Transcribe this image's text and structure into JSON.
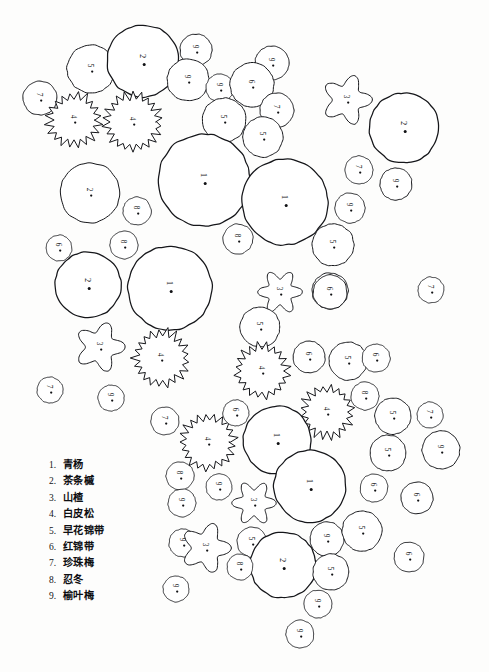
{
  "drawing": {
    "title": "园林种植平面图",
    "background_color": "#fdfdfc",
    "ink_color": "#15161a",
    "legend": {
      "items": [
        {
          "num": "1.",
          "name": "青杨"
        },
        {
          "num": "2.",
          "name": "茶条槭"
        },
        {
          "num": "3.",
          "name": "山楂"
        },
        {
          "num": "4.",
          "name": "白皮松"
        },
        {
          "num": "5.",
          "name": "早花锦带"
        },
        {
          "num": "6.",
          "name": "红锦带"
        },
        {
          "num": "7.",
          "name": "珍珠梅"
        },
        {
          "num": "8.",
          "name": "忍冬"
        },
        {
          "num": "9.",
          "name": "榆叶梅"
        }
      ]
    },
    "symbol_types": {
      "circle": "plain circle canopy outline",
      "spiky": "conifer canopy with sawtooth edge (白皮松)",
      "lobed": "cloud/flower lobed canopy (山楂)"
    },
    "plants": [
      {
        "id": "p01",
        "label": "7",
        "shape": "circle",
        "cx": 40,
        "cy": 98,
        "r": 17
      },
      {
        "id": "p02",
        "label": "5",
        "shape": "circle",
        "cx": 91,
        "cy": 69,
        "r": 24
      },
      {
        "id": "p03",
        "label": "2",
        "shape": "circle",
        "cx": 143,
        "cy": 61,
        "r": 36
      },
      {
        "id": "p04",
        "label": "9",
        "shape": "circle",
        "cx": 196,
        "cy": 50,
        "r": 16
      },
      {
        "id": "p05",
        "label": "9",
        "shape": "circle",
        "cx": 188,
        "cy": 80,
        "r": 21
      },
      {
        "id": "p06",
        "label": "9",
        "shape": "circle",
        "cx": 220,
        "cy": 88,
        "r": 14
      },
      {
        "id": "p07",
        "label": "9",
        "shape": "circle",
        "cx": 272,
        "cy": 63,
        "r": 17
      },
      {
        "id": "p08",
        "label": "6",
        "shape": "circle",
        "cx": 252,
        "cy": 85,
        "r": 22
      },
      {
        "id": "p09",
        "label": "7",
        "shape": "circle",
        "cx": 277,
        "cy": 110,
        "r": 17
      },
      {
        "id": "p10",
        "label": "5",
        "shape": "circle",
        "cx": 224,
        "cy": 120,
        "r": 22
      },
      {
        "id": "p11",
        "label": "5",
        "shape": "circle",
        "cx": 263,
        "cy": 137,
        "r": 20
      },
      {
        "id": "p12",
        "label": "4",
        "shape": "spiky",
        "cx": 74,
        "cy": 120,
        "r": 26
      },
      {
        "id": "p13",
        "label": "4",
        "shape": "spiky",
        "cx": 133,
        "cy": 122,
        "r": 28
      },
      {
        "id": "p14",
        "label": "3",
        "shape": "lobed",
        "cx": 347,
        "cy": 100,
        "r": 25
      },
      {
        "id": "p15",
        "label": "2",
        "shape": "circle",
        "cx": 404,
        "cy": 128,
        "r": 35
      },
      {
        "id": "p16",
        "label": "7",
        "shape": "circle",
        "cx": 359,
        "cy": 170,
        "r": 14
      },
      {
        "id": "p17",
        "label": "9",
        "shape": "circle",
        "cx": 396,
        "cy": 184,
        "r": 16
      },
      {
        "id": "p18",
        "label": "9",
        "shape": "circle",
        "cx": 350,
        "cy": 208,
        "r": 15
      },
      {
        "id": "p19",
        "label": "5",
        "shape": "circle",
        "cx": 333,
        "cy": 245,
        "r": 21
      },
      {
        "id": "p20",
        "label": "6",
        "shape": "circle",
        "cx": 330,
        "cy": 291,
        "r": 18
      },
      {
        "id": "p21",
        "label": "1",
        "shape": "circle",
        "cx": 204,
        "cy": 180,
        "r": 46
      },
      {
        "id": "p22",
        "label": "2",
        "shape": "circle",
        "cx": 90,
        "cy": 193,
        "r": 30
      },
      {
        "id": "p23",
        "label": "8",
        "shape": "circle",
        "cx": 137,
        "cy": 211,
        "r": 14
      },
      {
        "id": "p24",
        "label": "1",
        "shape": "circle",
        "cx": 285,
        "cy": 202,
        "r": 43
      },
      {
        "id": "p25",
        "label": "8",
        "shape": "circle",
        "cx": 238,
        "cy": 239,
        "r": 15
      },
      {
        "id": "p26",
        "label": "8",
        "shape": "circle",
        "cx": 124,
        "cy": 245,
        "r": 14
      },
      {
        "id": "p27",
        "label": "6",
        "shape": "circle",
        "cx": 59,
        "cy": 248,
        "r": 13
      },
      {
        "id": "p28",
        "label": "2",
        "shape": "circle",
        "cx": 88,
        "cy": 285,
        "r": 33
      },
      {
        "id": "p29",
        "label": "1",
        "shape": "circle",
        "cx": 170,
        "cy": 288,
        "r": 42
      },
      {
        "id": "p30",
        "label": "3",
        "shape": "lobed",
        "cx": 100,
        "cy": 347,
        "r": 25
      },
      {
        "id": "p31",
        "label": "4",
        "shape": "spiky",
        "cx": 161,
        "cy": 358,
        "r": 27
      },
      {
        "id": "p32",
        "label": "3",
        "shape": "lobed",
        "cx": 280,
        "cy": 292,
        "r": 22
      },
      {
        "id": "p33",
        "label": "6",
        "shape": "circle",
        "cx": 330,
        "cy": 292,
        "r": 17
      },
      {
        "id": "p34",
        "label": "7",
        "shape": "circle",
        "cx": 431,
        "cy": 290,
        "r": 13
      },
      {
        "id": "p35",
        "label": "7",
        "shape": "circle",
        "cx": 50,
        "cy": 390,
        "r": 13
      },
      {
        "id": "p36",
        "label": "9",
        "shape": "circle",
        "cx": 111,
        "cy": 398,
        "r": 13
      },
      {
        "id": "p37",
        "label": "5",
        "shape": "circle",
        "cx": 260,
        "cy": 327,
        "r": 20
      },
      {
        "id": "p38",
        "label": "4",
        "shape": "spiky",
        "cx": 262,
        "cy": 371,
        "r": 26
      },
      {
        "id": "p39",
        "label": "6",
        "shape": "circle",
        "cx": 309,
        "cy": 357,
        "r": 16
      },
      {
        "id": "p40",
        "label": "5",
        "shape": "circle",
        "cx": 348,
        "cy": 361,
        "r": 19
      },
      {
        "id": "p41",
        "label": "6",
        "shape": "circle",
        "cx": 376,
        "cy": 358,
        "r": 14
      },
      {
        "id": "p42",
        "label": "8",
        "shape": "circle",
        "cx": 365,
        "cy": 396,
        "r": 14
      },
      {
        "id": "p43",
        "label": "4",
        "shape": "spiky",
        "cx": 327,
        "cy": 412,
        "r": 25
      },
      {
        "id": "p44",
        "label": "5",
        "shape": "circle",
        "cx": 393,
        "cy": 416,
        "r": 18
      },
      {
        "id": "p45",
        "label": "7",
        "shape": "circle",
        "cx": 430,
        "cy": 415,
        "r": 13
      },
      {
        "id": "p46",
        "label": "9",
        "shape": "circle",
        "cx": 441,
        "cy": 450,
        "r": 19
      },
      {
        "id": "p47",
        "label": "5",
        "shape": "circle",
        "cx": 388,
        "cy": 453,
        "r": 18
      },
      {
        "id": "p48",
        "label": "7",
        "shape": "circle",
        "cx": 165,
        "cy": 421,
        "r": 14
      },
      {
        "id": "p49",
        "label": "4",
        "shape": "spiky",
        "cx": 208,
        "cy": 442,
        "r": 27
      },
      {
        "id": "p50",
        "label": "6",
        "shape": "circle",
        "cx": 236,
        "cy": 413,
        "r": 13
      },
      {
        "id": "p51",
        "label": "1",
        "shape": "circle",
        "cx": 277,
        "cy": 440,
        "r": 34
      },
      {
        "id": "p52",
        "label": "8",
        "shape": "circle",
        "cx": 180,
        "cy": 476,
        "r": 14
      },
      {
        "id": "p53",
        "label": "9",
        "shape": "circle",
        "cx": 219,
        "cy": 487,
        "r": 13
      },
      {
        "id": "p54",
        "label": "1",
        "shape": "circle",
        "cx": 310,
        "cy": 486,
        "r": 36
      },
      {
        "id": "p55",
        "label": "6",
        "shape": "circle",
        "cx": 374,
        "cy": 488,
        "r": 14
      },
      {
        "id": "p56",
        "label": "6",
        "shape": "circle",
        "cx": 417,
        "cy": 498,
        "r": 16
      },
      {
        "id": "p57",
        "label": "9",
        "shape": "circle",
        "cx": 182,
        "cy": 503,
        "r": 14
      },
      {
        "id": "p58",
        "label": "3",
        "shape": "lobed",
        "cx": 254,
        "cy": 503,
        "r": 22
      },
      {
        "id": "p59",
        "label": "9",
        "shape": "circle",
        "cx": 183,
        "cy": 543,
        "r": 14
      },
      {
        "id": "p60",
        "label": "3",
        "shape": "lobed",
        "cx": 206,
        "cy": 548,
        "r": 25
      },
      {
        "id": "p61",
        "label": "5",
        "shape": "circle",
        "cx": 252,
        "cy": 542,
        "r": 15
      },
      {
        "id": "p62",
        "label": "2",
        "shape": "circle",
        "cx": 283,
        "cy": 565,
        "r": 33
      },
      {
        "id": "p63",
        "label": "9",
        "shape": "circle",
        "cx": 327,
        "cy": 539,
        "r": 17
      },
      {
        "id": "p64",
        "label": "5",
        "shape": "circle",
        "cx": 362,
        "cy": 531,
        "r": 20
      },
      {
        "id": "p65",
        "label": "5",
        "shape": "circle",
        "cx": 331,
        "cy": 572,
        "r": 18
      },
      {
        "id": "p66",
        "label": "9",
        "shape": "circle",
        "cx": 318,
        "cy": 604,
        "r": 14
      },
      {
        "id": "p67",
        "label": "6",
        "shape": "circle",
        "cx": 409,
        "cy": 557,
        "r": 15
      },
      {
        "id": "p68",
        "label": "8",
        "shape": "circle",
        "cx": 240,
        "cy": 567,
        "r": 13
      },
      {
        "id": "p69",
        "label": "9",
        "shape": "circle",
        "cx": 176,
        "cy": 589,
        "r": 13
      },
      {
        "id": "p70",
        "label": "9",
        "shape": "circle",
        "cx": 300,
        "cy": 634,
        "r": 14
      }
    ]
  }
}
